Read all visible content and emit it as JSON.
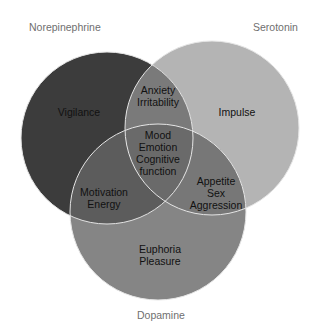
{
  "diagram": {
    "type": "venn",
    "sets": [
      {
        "id": "norepinephrine",
        "label": "Norepinephrine",
        "color": "#3a3a3a"
      },
      {
        "id": "serotonin",
        "label": "Serotonin",
        "color": "#b4b4b4"
      },
      {
        "id": "dopamine",
        "label": "Dopamine",
        "color": "#858585"
      }
    ],
    "regions": {
      "norepinephrine_only": [
        "Vigilance"
      ],
      "serotonin_only": [
        "Impulse"
      ],
      "dopamine_only": [
        "Euphoria",
        "Pleasure"
      ],
      "norepinephrine_serotonin": [
        "Anxiety",
        "Irritability"
      ],
      "norepinephrine_dopamine": [
        "Motivation",
        "Energy"
      ],
      "serotonin_dopamine": [
        "Appetite",
        "Sex",
        "Aggression"
      ],
      "all_three": [
        "Mood",
        "Emotion",
        "Cognitive",
        "function"
      ]
    },
    "outline_color": "#e8e8e8"
  }
}
